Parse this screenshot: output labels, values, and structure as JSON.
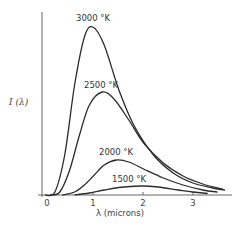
{
  "chart_data": {
    "type": "line",
    "title": "",
    "xlabel": "λ (microns)",
    "ylabel": "I (λ)",
    "xlim": [
      0,
      3.7
    ],
    "ylim": [
      0,
      175
    ],
    "x_ticks": [
      "0",
      "1",
      "2",
      "3"
    ],
    "y_ticks": [],
    "grid": false,
    "legend": "inline labels at curve peaks",
    "series": [
      {
        "name": "3000 °K",
        "label": "3000 °K",
        "peak_x": 0.97,
        "peak_y": 168,
        "points": [
          [
            0.0,
            0
          ],
          [
            0.2,
            3
          ],
          [
            0.4,
            40
          ],
          [
            0.6,
            110
          ],
          [
            0.8,
            158
          ],
          [
            0.97,
            168
          ],
          [
            1.2,
            150
          ],
          [
            1.5,
            105
          ],
          [
            1.8,
            70
          ],
          [
            2.2,
            40
          ],
          [
            2.6,
            22
          ],
          [
            3.0,
            12
          ],
          [
            3.4,
            7
          ],
          [
            3.65,
            5
          ]
        ]
      },
      {
        "name": "2500 °K",
        "label": "2500 °K",
        "peak_x": 1.16,
        "peak_y": 103,
        "points": [
          [
            0.1,
            0
          ],
          [
            0.3,
            3
          ],
          [
            0.5,
            25
          ],
          [
            0.7,
            60
          ],
          [
            0.9,
            90
          ],
          [
            1.16,
            103
          ],
          [
            1.4,
            96
          ],
          [
            1.7,
            75
          ],
          [
            2.0,
            52
          ],
          [
            2.4,
            32
          ],
          [
            2.8,
            19
          ],
          [
            3.2,
            11
          ],
          [
            3.6,
            6
          ]
        ]
      },
      {
        "name": "2000 °K",
        "label": "2000 °K",
        "peak_x": 1.45,
        "peak_y": 35,
        "points": [
          [
            0.35,
            0
          ],
          [
            0.6,
            3
          ],
          [
            0.8,
            10
          ],
          [
            1.0,
            20
          ],
          [
            1.2,
            30
          ],
          [
            1.45,
            35
          ],
          [
            1.7,
            33
          ],
          [
            2.0,
            26
          ],
          [
            2.4,
            17
          ],
          [
            2.8,
            10
          ],
          [
            3.2,
            5
          ],
          [
            3.5,
            3
          ]
        ]
      },
      {
        "name": "1500 °K",
        "label": "1500 °K",
        "peak_x": 1.93,
        "peak_y": 9,
        "points": [
          [
            0.6,
            0
          ],
          [
            0.9,
            2
          ],
          [
            1.2,
            5
          ],
          [
            1.5,
            7.5
          ],
          [
            1.93,
            9
          ],
          [
            2.3,
            8
          ],
          [
            2.7,
            5
          ],
          [
            3.0,
            3
          ],
          [
            3.3,
            1.5
          ]
        ]
      }
    ]
  },
  "labels": {
    "curve_3000": "3000 °K",
    "curve_2500": "2500 °K",
    "curve_2000": "2000 °K",
    "curve_1500": "1500 °K",
    "y_axis": "I (λ)",
    "x_axis": "λ (microns)",
    "tick_0": "0",
    "tick_1": "1",
    "tick_2": "2",
    "tick_3": "3"
  },
  "colors": {
    "line": "#2b2b2b",
    "axis": "#555555",
    "background": "#ffffff"
  }
}
